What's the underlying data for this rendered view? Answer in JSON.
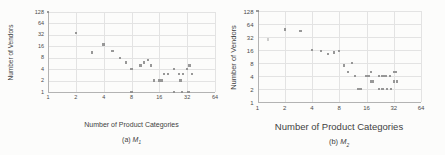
{
  "figure": {
    "background_color": "#fcfcfb",
    "marker_color": "#8a8a8a",
    "gridline_color": "#e3e3e3",
    "axis_color": "#b3b3b3",
    "text_color": "#3f3f3f"
  },
  "chart_data": [
    {
      "type": "scatter",
      "caption": {
        "prefix": "(a)",
        "symbol": "M",
        "sub": "1"
      },
      "xlabel": "Number of Product Categories",
      "ylabel": "Number of Vendors",
      "x_scale": "log2",
      "y_scale": "log2",
      "xlim": [
        1,
        64
      ],
      "ylim": [
        1,
        128
      ],
      "x_ticks": [
        1,
        2,
        4,
        8,
        16,
        32,
        64
      ],
      "y_ticks": [
        128,
        64,
        32,
        16,
        8,
        4,
        2,
        1
      ],
      "grid": true,
      "legend": false,
      "points": [
        [
          1,
          128
        ],
        [
          2,
          36
        ],
        [
          3,
          11
        ],
        [
          4,
          18
        ],
        [
          5,
          12
        ],
        [
          6,
          8
        ],
        [
          7,
          6
        ],
        [
          8,
          4
        ],
        [
          8,
          1
        ],
        [
          10,
          5
        ],
        [
          11,
          6
        ],
        [
          12,
          7
        ],
        [
          13,
          5
        ],
        [
          14,
          2
        ],
        [
          16,
          2
        ],
        [
          17,
          2
        ],
        [
          18,
          3
        ],
        [
          20,
          3
        ],
        [
          23,
          4
        ],
        [
          23,
          1
        ],
        [
          26,
          3
        ],
        [
          27,
          2
        ],
        [
          28,
          1
        ],
        [
          29,
          3
        ],
        [
          32,
          4
        ],
        [
          33,
          1
        ],
        [
          34,
          5
        ],
        [
          36,
          3
        ]
      ]
    },
    {
      "type": "scatter",
      "caption": {
        "prefix": "(b)",
        "symbol": "M",
        "sub": "2"
      },
      "xlabel": "Number of Product Categories",
      "ylabel": "Number of Vendors",
      "x_scale": "log2",
      "y_scale": "log2",
      "xlim": [
        1,
        64
      ],
      "ylim": [
        1,
        128
      ],
      "x_ticks": [
        1,
        2,
        4,
        8,
        16,
        32,
        64
      ],
      "y_ticks": [
        128,
        64,
        32,
        16,
        8,
        4,
        2,
        1
      ],
      "grid": true,
      "legend": false,
      "points": [
        [
          1,
          128
        ],
        [
          1.3,
          28,
          1
        ],
        [
          2,
          48
        ],
        [
          3,
          44
        ],
        [
          4,
          16
        ],
        [
          5,
          15
        ],
        [
          6,
          13
        ],
        [
          7,
          14
        ],
        [
          8,
          15
        ],
        [
          9,
          7
        ],
        [
          10,
          5
        ],
        [
          11,
          8
        ],
        [
          12,
          4
        ],
        [
          13,
          2
        ],
        [
          14,
          2
        ],
        [
          16,
          4
        ],
        [
          17,
          4
        ],
        [
          18,
          5
        ],
        [
          18,
          3
        ],
        [
          19,
          3
        ],
        [
          22,
          4
        ],
        [
          22,
          2
        ],
        [
          24,
          4
        ],
        [
          24,
          2
        ],
        [
          26,
          4
        ],
        [
          27,
          2
        ],
        [
          29,
          4
        ],
        [
          30,
          2
        ],
        [
          32,
          5
        ],
        [
          32,
          3
        ],
        [
          34,
          5
        ],
        [
          35,
          3
        ]
      ]
    }
  ]
}
